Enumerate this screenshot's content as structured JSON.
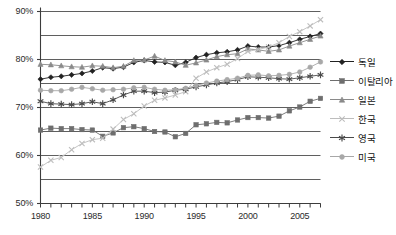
{
  "chart_data": {
    "type": "line",
    "title": "",
    "subtitle": "",
    "xlabel": "",
    "ylabel": "",
    "xlim": [
      1980,
      2007
    ],
    "ylim": [
      50,
      90
    ],
    "ytick_labels": [
      "90%",
      "80%",
      "70%",
      "60%",
      "50%"
    ],
    "ytick_values": [
      90,
      80,
      70,
      60,
      50
    ],
    "gridlines_y": [
      90,
      85,
      80,
      75,
      70,
      65,
      60,
      55,
      50
    ],
    "grid": true,
    "legend_position": "right",
    "x": [
      1980,
      1981,
      1982,
      1983,
      1984,
      1985,
      1986,
      1987,
      1988,
      1989,
      1990,
      1991,
      1992,
      1993,
      1994,
      1995,
      1996,
      1997,
      1998,
      1999,
      2000,
      2001,
      2002,
      2003,
      2004,
      2005,
      2006,
      2007
    ],
    "xtick_labels": [
      "1980",
      "1985",
      "1990",
      "1995",
      "2000",
      "2005"
    ],
    "xtick_values": [
      1980,
      1985,
      1990,
      1995,
      2000,
      2005
    ],
    "series": [
      {
        "name": "독일",
        "marker": "diamond",
        "color": "#222222",
        "values": [
          75.9,
          76.3,
          76.5,
          76.8,
          77.1,
          77.6,
          78.3,
          78.1,
          78.4,
          79.4,
          79.8,
          79.5,
          79.4,
          78.8,
          79.4,
          80.4,
          81.0,
          81.4,
          81.6,
          82.0,
          82.8,
          82.6,
          82.6,
          82.9,
          83.5,
          84.2,
          84.8,
          85.4
        ]
      },
      {
        "name": "이탈리아",
        "marker": "square",
        "color": "#6e6e6e",
        "values": [
          65.3,
          65.7,
          65.6,
          65.6,
          65.4,
          65.3,
          64.0,
          64.7,
          65.8,
          66.0,
          65.6,
          65.0,
          64.9,
          63.9,
          64.6,
          66.4,
          66.6,
          66.9,
          66.8,
          67.4,
          67.9,
          67.9,
          67.8,
          68.2,
          69.3,
          70.1,
          71.3,
          71.9
        ]
      },
      {
        "name": "일본",
        "marker": "triangle",
        "color": "#8a8a8a",
        "values": [
          79.0,
          78.9,
          78.7,
          78.5,
          78.4,
          78.7,
          78.6,
          78.3,
          78.6,
          79.8,
          79.9,
          80.7,
          79.8,
          79.5,
          78.8,
          79.3,
          79.9,
          80.6,
          81.0,
          81.2,
          82.2,
          82.0,
          81.7,
          82.0,
          82.8,
          83.5,
          84.2,
          84.9
        ]
      },
      {
        "name": "한국",
        "marker": "x",
        "color": "#bdbdbd",
        "values": [
          57.6,
          59.0,
          59.6,
          61.2,
          62.5,
          63.3,
          63.6,
          65.5,
          67.5,
          68.7,
          70.3,
          71.5,
          72.0,
          72.6,
          73.3,
          76.1,
          77.4,
          78.3,
          79.0,
          80.2,
          81.7,
          82.1,
          82.6,
          83.5,
          84.8,
          85.8,
          87.0,
          88.3
        ]
      },
      {
        "name": "영국",
        "marker": "asterisk",
        "color": "#4a4a4a",
        "values": [
          71.3,
          70.8,
          70.7,
          70.6,
          70.8,
          71.2,
          70.8,
          71.6,
          72.6,
          73.4,
          73.4,
          73.1,
          73.2,
          73.6,
          73.8,
          74.3,
          74.7,
          75.1,
          75.4,
          75.8,
          76.4,
          76.3,
          76.2,
          76.0,
          75.9,
          76.2,
          76.5,
          76.8
        ]
      },
      {
        "name": "미국",
        "marker": "circle",
        "color": "#a8a8a8",
        "values": [
          73.6,
          73.5,
          73.5,
          73.8,
          74.2,
          73.9,
          73.6,
          73.7,
          73.8,
          74.1,
          74.2,
          73.8,
          73.6,
          73.7,
          74.0,
          74.6,
          75.1,
          75.5,
          75.8,
          76.1,
          76.7,
          76.8,
          76.6,
          76.7,
          76.9,
          77.4,
          78.4,
          79.5
        ]
      }
    ]
  },
  "legend": {
    "items": [
      {
        "label": "독일",
        "marker": "diamond-marker"
      },
      {
        "label": "이탈리아",
        "marker": "square-marker"
      },
      {
        "label": "일본",
        "marker": "triangle-marker"
      },
      {
        "label": "한국",
        "marker": "x-marker"
      },
      {
        "label": "영국",
        "marker": "asterisk-marker"
      },
      {
        "label": "미국",
        "marker": "circle-marker"
      }
    ]
  },
  "colors": {
    "axis": "#3c3c3c",
    "grid": "#4d4d4d",
    "background": "#ffffff"
  }
}
